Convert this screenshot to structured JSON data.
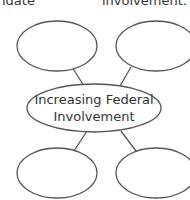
{
  "header": {
    "left_fragment": "idate",
    "right_fragment": "involvement."
  },
  "diagram": {
    "center": {
      "line1": "Increasing Federal",
      "line2": "Involvement"
    },
    "outer_nodes": [
      {
        "position": "top-left",
        "text": ""
      },
      {
        "position": "top-right",
        "text": ""
      },
      {
        "position": "bottom-left",
        "text": ""
      },
      {
        "position": "bottom-right",
        "text": ""
      }
    ],
    "stroke_color": "#555555"
  }
}
